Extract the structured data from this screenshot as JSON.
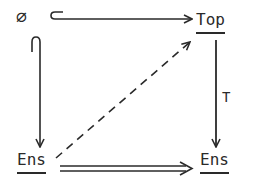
{
  "diagram": {
    "type": "commutative-diagram",
    "nodes": {
      "empty": {
        "label": "∅"
      },
      "top": {
        "label": "Top"
      },
      "ens_left": {
        "label": "Ens"
      },
      "ens_right": {
        "label": "Ens"
      }
    },
    "arrows": [
      {
        "id": "empty-to-top",
        "from": "empty",
        "to": "top",
        "style": "hook-inclusion",
        "label": ""
      },
      {
        "id": "empty-to-ens",
        "from": "empty",
        "to": "ens_left",
        "style": "hook-inclusion",
        "label": ""
      },
      {
        "id": "top-to-ens",
        "from": "top",
        "to": "ens_right",
        "style": "solid",
        "label": "T"
      },
      {
        "id": "ens-to-top",
        "from": "ens_left",
        "to": "top",
        "style": "dashed",
        "label": ""
      },
      {
        "id": "ens-to-ens",
        "from": "ens_left",
        "to": "ens_right",
        "style": "double",
        "label": ""
      }
    ],
    "colors": {
      "ink": "#2a2a2a",
      "background": "#ffffff"
    }
  }
}
